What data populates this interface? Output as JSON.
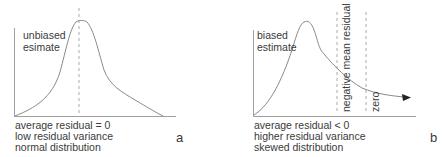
{
  "panel_a": {
    "curve_label_line1": "unbiased",
    "curve_label_line2": "esimate",
    "caption": [
      "average residual = 0",
      "low residual variance",
      "normal distribution"
    ],
    "tag": "a"
  },
  "panel_b": {
    "curve_label_line1": "biased",
    "curve_label_line2": "estimate",
    "marker_negative_mean": "negative mean residual",
    "marker_zero": "zero",
    "caption": [
      "average residual < 0",
      "higher residual variance",
      "skewed distribution"
    ],
    "tag": "b"
  },
  "colors": {
    "line": "#8a8a8a",
    "axis": "#9a9a9a",
    "text": "#3a3a3a",
    "arrow": "#222222"
  }
}
